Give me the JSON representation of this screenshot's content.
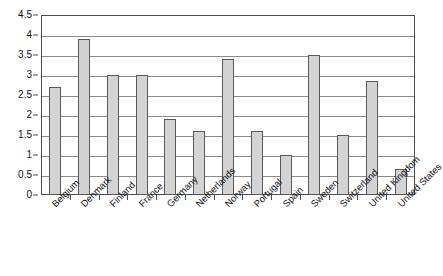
{
  "chart_data": {
    "type": "bar",
    "title": "",
    "subtitle": "",
    "xlabel": "",
    "ylabel": "",
    "categories": [
      "Belgium",
      "Denmark",
      "Finland",
      "France",
      "Germany",
      "Netherlands",
      "Norway",
      "Portugal",
      "Spain",
      "Sweden",
      "Switzerland",
      "United Kingdom",
      "United States"
    ],
    "values": [
      2.7,
      3.9,
      3.0,
      3.0,
      1.9,
      1.6,
      3.4,
      1.6,
      1.0,
      3.5,
      1.5,
      2.85,
      0.65
    ],
    "ylim": [
      0,
      4.5
    ],
    "y_ticks": [
      0,
      0.5,
      1,
      1.5,
      2,
      2.5,
      3,
      3.5,
      4,
      4.5
    ],
    "y_tick_labels": [
      "0",
      "0.5",
      "1",
      "1.5",
      "2",
      "2.5",
      "3",
      "3.5",
      "4",
      "4.5"
    ],
    "grid": true,
    "grid_axis": "y",
    "legend": false,
    "legend_position": "none",
    "x_label_rotation": -45,
    "bar_fill_color": "#d3d3d3",
    "bar_border_color": "#585858",
    "gridline_color": "#8a8a8a",
    "axis_color": "#4d4d4d",
    "background_color": "#ffffff"
  }
}
